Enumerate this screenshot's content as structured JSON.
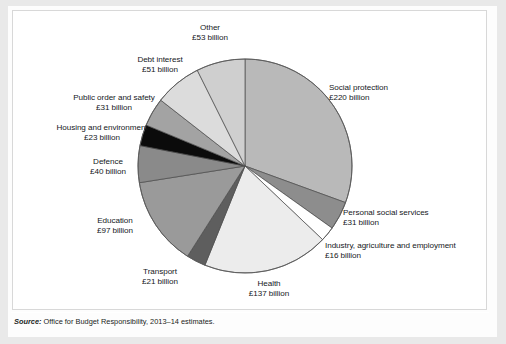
{
  "figure": {
    "source_prefix": "Source:",
    "source_text": " Office for Budget Responsibility, 2013–14 estimates."
  },
  "chart_data": {
    "type": "pie",
    "title": "",
    "unit": "£ billion",
    "total": 720,
    "legend_position": "callout-labels",
    "grid": false,
    "start_angle_deg": 0,
    "direction": "clockwise",
    "categories": [
      "Social protection",
      "Personal social services",
      "Industry, agriculture and employment",
      "Health",
      "Transport",
      "Education",
      "Defence",
      "Housing and environment",
      "Public order and safety",
      "Debt interest",
      "Other"
    ],
    "values": [
      220,
      31,
      16,
      137,
      21,
      97,
      40,
      23,
      31,
      51,
      53
    ],
    "value_labels": [
      "£220 billion",
      "£31 billion",
      "£16 billion",
      "£137 billion",
      "£21 billion",
      "£97 billion",
      "£40 billion",
      "£23 billion",
      "£31 billion",
      "£51 billion",
      "£53 billion"
    ],
    "colors": [
      "#b9b9b9",
      "#8d8d8d",
      "#ffffff",
      "#ececec",
      "#5e5e5e",
      "#9a9a9a",
      "#8a8a8a",
      "#0b0b0b",
      "#a3a3a3",
      "#dcdcdc",
      "#cfcfcf"
    ],
    "slices": [
      {
        "label": "Social protection",
        "value_label": "£220 billion",
        "value": 220,
        "color": "#b9b9b9"
      },
      {
        "label": "Personal social services",
        "value_label": "£31 billion",
        "value": 31,
        "color": "#8d8d8d"
      },
      {
        "label": "Industry, agriculture and employment",
        "value_label": "£16 billion",
        "value": 16,
        "color": "#ffffff"
      },
      {
        "label": "Health",
        "value_label": "£137 billion",
        "value": 137,
        "color": "#ececec"
      },
      {
        "label": "Transport",
        "value_label": "£21 billion",
        "value": 21,
        "color": "#5e5e5e"
      },
      {
        "label": "Education",
        "value_label": "£97 billion",
        "value": 97,
        "color": "#9a9a9a"
      },
      {
        "label": "Defence",
        "value_label": "£40 billion",
        "value": 40,
        "color": "#8a8a8a"
      },
      {
        "label": "Housing and environment",
        "value_label": "£23 billion",
        "value": 23,
        "color": "#0b0b0b"
      },
      {
        "label": "Public order and safety",
        "value_label": "£31 billion",
        "value": 31,
        "color": "#a3a3a3"
      },
      {
        "label": "Debt interest",
        "value_label": "£51 billion",
        "value": 51,
        "color": "#dcdcdc"
      },
      {
        "label": "Other",
        "value_label": "£53 billion",
        "value": 53,
        "color": "#cfcfcf"
      }
    ]
  }
}
